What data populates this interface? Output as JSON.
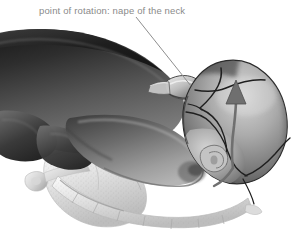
{
  "figure": {
    "name": "fetal-head-rotation-illustration",
    "background_color": "#ffffff",
    "width": 301,
    "height": 240,
    "style": "grayscale medical illustration"
  },
  "annotation": {
    "label": "point of rotation: nape of the neck",
    "text_color": "#8a8a8a",
    "leader_line_color": "#8e8e8e",
    "leader_from": [
      136,
      17
    ],
    "leader_to": [
      191,
      86
    ]
  },
  "anatomy": {
    "fetal_body_label": "fetal trunk",
    "fetal_head_label": "fetal head",
    "fetal_shoulder_label": "fetal shoulder and arm",
    "fetal_ear_label": "fetal ear",
    "nape_label": "nape of the neck",
    "pelvis_label": "maternal pelvis",
    "sacrum_label": "sacrum and coccyx",
    "suture_label": "cranial suture lines",
    "rotation_arrow_label": "direction of head rotation"
  },
  "colors": {
    "body_dark": "#2b2b2b",
    "body_mid": "#5e5e5e",
    "body_light": "#9a9a9a",
    "head_dark": "#4a4a4a",
    "head_mid": "#8c8c8c",
    "head_light": "#c9c9c9",
    "bone_light": "#e8e8e8",
    "bone_mid": "#c4c4c4",
    "suture_line": "#262626",
    "arrow_fill": "#6f6f6f",
    "outline": "#1f1f1f"
  }
}
